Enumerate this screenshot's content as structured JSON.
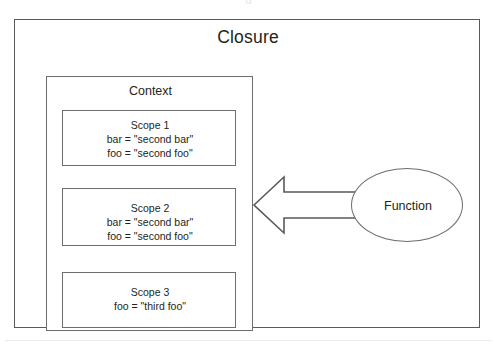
{
  "diagram": {
    "title": "Closure",
    "top_cropped_text": "g",
    "context": {
      "title": "Context",
      "scopes": [
        {
          "title": "Scope 1",
          "lines": [
            "bar = \"second bar\"",
            "foo = \"second foo\""
          ]
        },
        {
          "title": "Scope 2",
          "lines": [
            "bar = \"second bar\"",
            "foo = \"second foo\""
          ]
        },
        {
          "title": "Scope 3",
          "lines": [
            "foo = \"third foo\""
          ]
        }
      ]
    },
    "function_node": {
      "label": "Function"
    },
    "arrow": {
      "name": "function-to-context-arrow",
      "direction": "left"
    },
    "colors": {
      "stroke": "#6d6e71",
      "outer_stroke": "#58595b",
      "text": "#231f20",
      "background": "#ffffff",
      "separator": "#eceaea"
    }
  }
}
